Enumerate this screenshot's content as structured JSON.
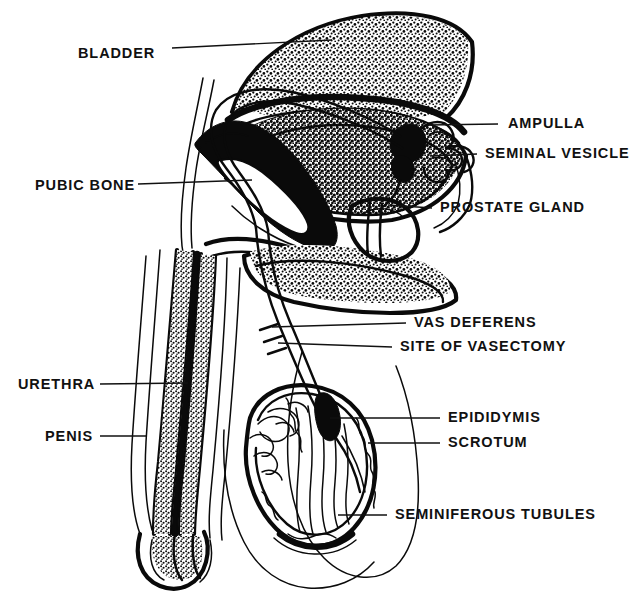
{
  "figure": {
    "background_color": "#ffffff",
    "ink_color": "#0a0a0a",
    "style": "black-and-white line drawing, stippled cross-section"
  },
  "labels": [
    {
      "id": "bladder",
      "text": "BLADDER",
      "side": "left",
      "text_x": 78,
      "text_y": 54,
      "leader_from_x": 172,
      "leader_from_y": 48,
      "leader_to_x": 332,
      "leader_to_y": 40
    },
    {
      "id": "pubic-bone",
      "text": "PUBIC BONE",
      "side": "left",
      "text_x": 35,
      "text_y": 186,
      "leader_from_x": 138,
      "leader_from_y": 184,
      "leader_to_x": 252,
      "leader_to_y": 180
    },
    {
      "id": "urethra",
      "text": "URETHRA",
      "side": "left",
      "text_x": 18,
      "text_y": 385,
      "leader_from_x": 100,
      "leader_from_y": 384,
      "leader_to_x": 188,
      "leader_to_y": 383
    },
    {
      "id": "penis",
      "text": "PENIS",
      "side": "left",
      "text_x": 45,
      "text_y": 437,
      "leader_from_x": 100,
      "leader_from_y": 436,
      "leader_to_x": 146,
      "leader_to_y": 436
    },
    {
      "id": "ampulla",
      "text": "AMPULLA",
      "side": "right",
      "text_x": 508,
      "text_y": 124,
      "leader_from_x": 428,
      "leader_from_y": 125,
      "leader_to_x": 498,
      "leader_to_y": 124
    },
    {
      "id": "seminal-vesicle",
      "text": "SEMINAL VESICLE",
      "side": "right",
      "text_x": 485,
      "text_y": 154,
      "leader_from_x": 430,
      "leader_from_y": 156,
      "leader_to_x": 477,
      "leader_to_y": 154
    },
    {
      "id": "prostate-gland",
      "text": "PROSTATE GLAND",
      "side": "right",
      "text_x": 440,
      "text_y": 208,
      "leader_from_x": 388,
      "leader_from_y": 205,
      "leader_to_x": 432,
      "leader_to_y": 208
    },
    {
      "id": "vas-deferens",
      "text": "VAS DEFERENS",
      "side": "right",
      "text_x": 414,
      "text_y": 323,
      "leader_from_x": 272,
      "leader_from_y": 327,
      "leader_to_x": 406,
      "leader_to_y": 323
    },
    {
      "id": "site-of-vasectomy",
      "text": "SITE OF VASECTOMY",
      "side": "right",
      "text_x": 400,
      "text_y": 347,
      "leader_from_x": 278,
      "leader_from_y": 343,
      "leader_to_x": 392,
      "leader_to_y": 347
    },
    {
      "id": "epididymis",
      "text": "EPIDIDYMIS",
      "side": "right",
      "text_x": 448,
      "text_y": 418,
      "leader_from_x": 330,
      "leader_from_y": 418,
      "leader_to_x": 440,
      "leader_to_y": 418
    },
    {
      "id": "scrotum",
      "text": "SCROTUM",
      "side": "right",
      "text_x": 448,
      "text_y": 443,
      "leader_from_x": 368,
      "leader_from_y": 443,
      "leader_to_x": 440,
      "leader_to_y": 443
    },
    {
      "id": "seminiferous-tubules",
      "text": "SEMINIFEROUS TUBULES",
      "side": "right",
      "text_x": 395,
      "text_y": 515,
      "leader_from_x": 338,
      "leader_from_y": 515,
      "leader_to_x": 387,
      "leader_to_y": 515
    }
  ],
  "structures": [
    {
      "id": "bladder",
      "name": "Bladder"
    },
    {
      "id": "pubic-bone",
      "name": "Pubic bone"
    },
    {
      "id": "prostate-gland",
      "name": "Prostate gland"
    },
    {
      "id": "seminal-vesicle",
      "name": "Seminal vesicle"
    },
    {
      "id": "ampulla",
      "name": "Ampulla"
    },
    {
      "id": "vas-deferens",
      "name": "Vas deferens"
    },
    {
      "id": "vasectomy-site",
      "name": "Site of vasectomy"
    },
    {
      "id": "epididymis",
      "name": "Epididymis"
    },
    {
      "id": "testis",
      "name": "Testis / seminiferous tubules"
    },
    {
      "id": "scrotum",
      "name": "Scrotum"
    },
    {
      "id": "penis-shaft",
      "name": "Penis shaft"
    },
    {
      "id": "urethra",
      "name": "Urethra"
    },
    {
      "id": "abdominal-wall",
      "name": "Abdominal wall contour"
    }
  ]
}
